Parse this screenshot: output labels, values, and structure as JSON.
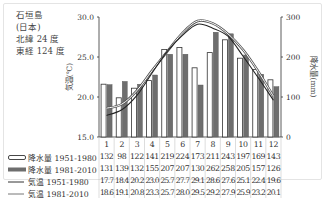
{
  "station": {
    "name": "石垣島",
    "country": "(日本)",
    "lat": "北緯 24 度",
    "lon": "東経 124 度"
  },
  "axes": {
    "left_label": "気温(℃)",
    "right_label": "降水量(mm)",
    "left_ticks": [
      "30.0",
      "25.0",
      "20.0",
      "15.0"
    ],
    "right_ticks": [
      "300",
      "200",
      "100",
      "0"
    ]
  },
  "table": {
    "months": [
      "1",
      "2",
      "3",
      "4",
      "5",
      "6",
      "7",
      "8",
      "9",
      "10",
      "11",
      "12"
    ],
    "rows": [
      {
        "label": "降水量 1951-1980",
        "values": [
          "132",
          "98",
          "122",
          "141",
          "219",
          "224",
          "173",
          "211",
          "243",
          "197",
          "169",
          "143"
        ]
      },
      {
        "label": "降水量 1981-2010",
        "values": [
          "131",
          "139",
          "132",
          "155",
          "207",
          "207",
          "130",
          "262",
          "258",
          "205",
          "157",
          "126"
        ]
      },
      {
        "label": "気温 1951-1980",
        "values": [
          "17.7",
          "18.4",
          "20.2",
          "23.0",
          "25.7",
          "27.7",
          "29.1",
          "28.6",
          "27.6",
          "25.1",
          "22.4",
          "19.6"
        ]
      },
      {
        "label": "気温 1981-2010",
        "values": [
          "18.6",
          "19.1",
          "20.8",
          "23.3",
          "25.7",
          "28.0",
          "29.5",
          "29.2",
          "27.9",
          "25.9",
          "23.2",
          "20.1"
        ]
      }
    ]
  },
  "chart_data": {
    "type": "bar+line",
    "title": "石垣島 (日本) 北緯 24 度 東経 124 度",
    "categories": [
      "1",
      "2",
      "3",
      "4",
      "5",
      "6",
      "7",
      "8",
      "9",
      "10",
      "11",
      "12"
    ],
    "xlabel": "",
    "ylabel_left": "気温(℃)",
    "ylabel_right": "降水量(mm)",
    "ylim_left": [
      15.0,
      30.0
    ],
    "ylim_right": [
      0,
      300
    ],
    "series": [
      {
        "name": "降水量 1951-1980",
        "type": "bar",
        "axis": "right",
        "color": "#ffffff",
        "values": [
          132,
          98,
          122,
          141,
          219,
          224,
          173,
          211,
          243,
          197,
          169,
          143
        ]
      },
      {
        "name": "降水量 1981-2010",
        "type": "bar",
        "axis": "right",
        "color": "#6e6e6e",
        "values": [
          131,
          139,
          132,
          155,
          207,
          207,
          130,
          262,
          258,
          205,
          157,
          126
        ]
      },
      {
        "name": "気温 1951-1980",
        "type": "line",
        "axis": "left",
        "color": "#333333",
        "values": [
          17.7,
          18.4,
          20.2,
          23.0,
          25.7,
          27.7,
          29.1,
          28.6,
          27.6,
          25.1,
          22.4,
          19.6
        ]
      },
      {
        "name": "気温 1981-2010",
        "type": "line",
        "axis": "left",
        "color": "#888888",
        "values": [
          18.6,
          19.1,
          20.8,
          23.3,
          25.7,
          28.0,
          29.5,
          29.2,
          27.9,
          25.9,
          23.2,
          20.1
        ]
      }
    ],
    "grid": false,
    "legend_position": "table-left"
  }
}
